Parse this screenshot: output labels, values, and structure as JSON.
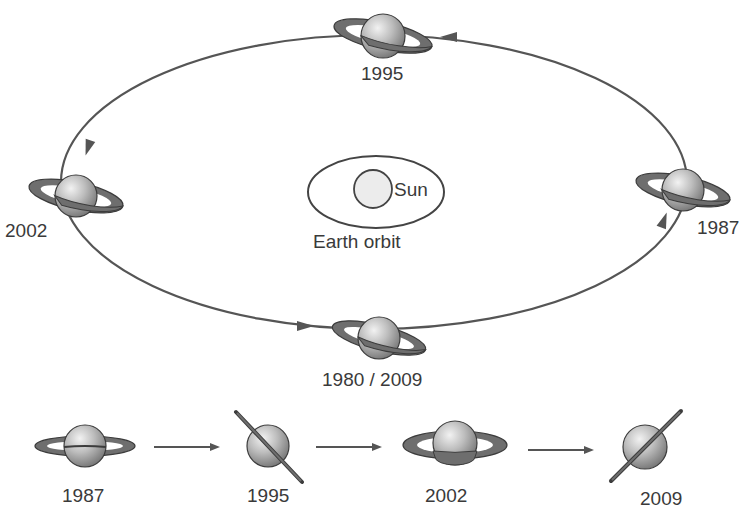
{
  "diagram": {
    "center": {
      "sun_label": "Sun",
      "earth_orbit_label": "Earth orbit"
    },
    "orbit_positions": [
      {
        "label": "1995",
        "position": "top"
      },
      {
        "label": "2002",
        "position": "left"
      },
      {
        "label": "1987",
        "position": "right"
      },
      {
        "label": "1980 / 2009",
        "position": "bottom"
      }
    ],
    "orbit_direction": "counter-clockwise",
    "ring_sequence": [
      {
        "label": "1987",
        "orientation": "ring-open-horizontal"
      },
      {
        "label": "1995",
        "orientation": "ring-edge-on-tilted-left"
      },
      {
        "label": "2002",
        "orientation": "ring-open-horizontal"
      },
      {
        "label": "2009",
        "orientation": "ring-edge-on-tilted-right"
      }
    ],
    "colors": {
      "line": "#555555",
      "ring": "#6e6e6e",
      "planet_light": "#e8e8e8",
      "planet_dark": "#7a7a7a",
      "sun_fill": "#ececec"
    }
  }
}
